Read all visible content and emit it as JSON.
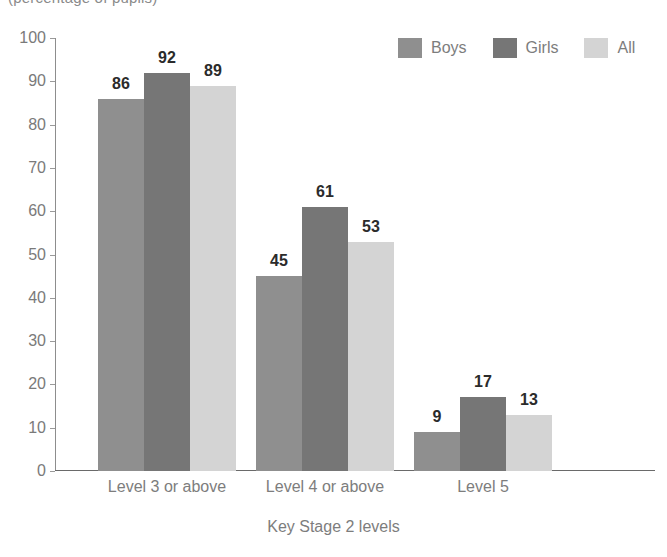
{
  "caption": "(percentage of pupils)",
  "chart_data": {
    "type": "bar",
    "title": "",
    "subtitle": "(percentage of pupils)",
    "xlabel": "Key Stage 2 levels",
    "ylabel": "",
    "categories": [
      "Level 3 or above",
      "Level 4 or above",
      "Level 5"
    ],
    "series": [
      {
        "name": "Boys",
        "color": "#8f8f8f",
        "values": [
          86,
          45,
          9
        ]
      },
      {
        "name": "Girls",
        "color": "#767676",
        "values": [
          92,
          61,
          17
        ]
      },
      {
        "name": "All",
        "color": "#d4d4d4",
        "values": [
          89,
          53,
          13
        ]
      }
    ],
    "ylim": [
      0,
      100
    ],
    "yticks": [
      0,
      10,
      20,
      30,
      40,
      50,
      60,
      70,
      80,
      90,
      100
    ],
    "ytick_labels": [
      "0",
      "10",
      "20",
      "30",
      "40",
      "50",
      "60",
      "70",
      "80",
      "90",
      "100"
    ],
    "grid": false,
    "legend_position": "top-right",
    "data_labels": true
  },
  "legend": {
    "items": [
      {
        "label": "Boys",
        "color": "#8f8f8f"
      },
      {
        "label": "Girls",
        "color": "#767676"
      },
      {
        "label": "All",
        "color": "#d4d4d4"
      }
    ]
  }
}
